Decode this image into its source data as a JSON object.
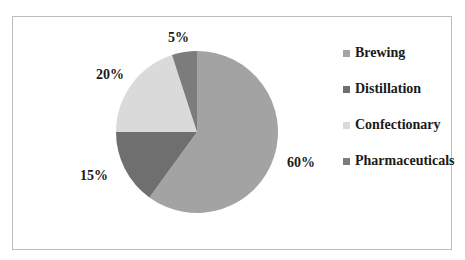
{
  "chart_data": {
    "type": "pie",
    "title": "",
    "categories": [
      "Brewing",
      "Distillation",
      "Confectionary",
      "Pharmaceuticals"
    ],
    "values": [
      60,
      15,
      20,
      5
    ],
    "labels": [
      "60%",
      "15%",
      "20%",
      "5%"
    ],
    "colors": [
      "#a3a3a3",
      "#6f6f6f",
      "#dadada",
      "#7c7c7c"
    ],
    "start_angle": "12 o'clock",
    "direction": "clockwise",
    "legend_position": "right"
  },
  "legend": {
    "items": [
      {
        "label": "Brewing",
        "color": "#a3a3a3"
      },
      {
        "label": "Distillation",
        "color": "#6f6f6f"
      },
      {
        "label": "Confectionary",
        "color": "#dadada"
      },
      {
        "label": "Pharmaceuticals",
        "color": "#7c7c7c"
      }
    ]
  }
}
